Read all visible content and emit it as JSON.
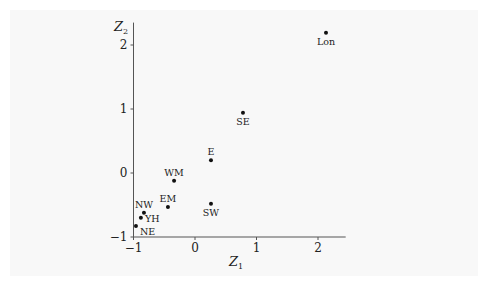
{
  "chart_data": {
    "type": "scatter",
    "title": "",
    "xlabel": "Z1",
    "ylabel": "Z2",
    "xlim": [
      -1,
      2.45
    ],
    "ylim": [
      -1,
      2.35
    ],
    "x_ticks": [
      -1,
      0,
      1,
      2
    ],
    "y_ticks": [
      -1,
      0,
      1,
      2
    ],
    "grid": false,
    "legend": null,
    "points": [
      {
        "label": "Lon",
        "x": 2.13,
        "y": 2.19,
        "label_pos": "below"
      },
      {
        "label": "SE",
        "x": 0.78,
        "y": 0.94,
        "label_pos": "below"
      },
      {
        "label": "E",
        "x": 0.26,
        "y": 0.2,
        "label_pos": "above"
      },
      {
        "label": "SW",
        "x": 0.26,
        "y": -0.48,
        "label_pos": "below"
      },
      {
        "label": "WM",
        "x": -0.34,
        "y": -0.12,
        "label_pos": "above"
      },
      {
        "label": "EM",
        "x": -0.44,
        "y": -0.53,
        "label_pos": "above"
      },
      {
        "label": "NW",
        "x": -0.83,
        "y": -0.62,
        "label_pos": "above"
      },
      {
        "label": "YH",
        "x": -0.88,
        "y": -0.7,
        "label_pos": "right"
      },
      {
        "label": "NE",
        "x": -0.96,
        "y": -0.83,
        "label_pos": "below-right"
      }
    ]
  },
  "axes": {
    "x_label_main": "Z",
    "x_label_sub": "1",
    "y_label_main": "Z",
    "y_label_sub": "2"
  },
  "colors": {
    "point": "#111111",
    "axis": "#555555",
    "panel": "#f8f8f8"
  }
}
